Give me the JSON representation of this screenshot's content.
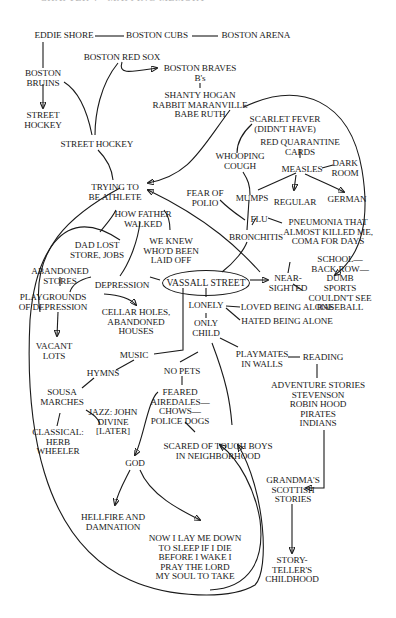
{
  "header": {
    "text": "CHAPTER 4 · MAPPING MEMORY"
  },
  "diagram": {
    "center": "VASSALL STREET",
    "nodes": {
      "eddie_shore": "EDDIE SHORE",
      "boston_cubs": "BOSTON CUBS",
      "boston_arena": "BOSTON ARENA",
      "boston_bruins": "BOSTON\nBRUINS",
      "street_hockey_1": "STREET\nHOCKEY",
      "boston_red_sox": "BOSTON RED SOX",
      "boston_braves": "BOSTON BRAVES\nB's",
      "braves_players": "SHANTY HOGAN\nRABBIT MARANVILLE\nBABE RUTH",
      "street_hockey_2": "STREET HOCKEY",
      "scarlet_fever": "SCARLET FEVER\n(DIDN'T HAVE)",
      "red_quarantine": "RED QUARANTINE\nCARDS",
      "whooping_cough": "WHOOPING\nCOUGH",
      "measles": "MEASLES",
      "dark_room": "DARK\nROOM",
      "trying_athlete": "TRYING TO\nBE ATHLETE",
      "fear_polio": "FEAR OF\nPOLIO",
      "mumps": "MUMPS",
      "regular": "REGULAR",
      "german": "GERMAN",
      "how_father_walked": "HOW FATHER\nWALKED",
      "flu": "FLU",
      "pneumonia": "PNEUMONIA THAT\nALMOST KILLED ME,\nCOMA FOR DAYS",
      "bronchitis": "BRONCHITIS",
      "dad_lost_store": "DAD LOST\nSTORE, JOBS",
      "we_knew": "WE KNEW\nWHO'D BEEN\nLAID OFF",
      "school": "SCHOOL—\nBACK ROW—\nDUMB",
      "abandoned_stores": "ABANDONED\nSTORES",
      "depression": "DEPRESSION",
      "near_sighted": "NEAR-\nSIGHTED",
      "sports": "SPORTS\nCOULDN'T SEE\nBASEBALL",
      "playgrounds": "PLAYGROUNDS\nOF DEPRESSION",
      "cellar_holes": "CELLAR HOLES,\nABANDONED\nHOUSES",
      "lonely": "LONELY",
      "loved_alone": "LOVED BEING ALONE",
      "hated_alone": "HATED BEING ALONE",
      "only_child": "ONLY\nCHILD",
      "vacant_lots": "VACANT\nLOTS",
      "music": "MUSIC",
      "playmates": "PLAYMATES\nIN WALLS",
      "reading": "READING",
      "hymns": "HYMNS",
      "no_pets": "NO PETS",
      "sousa": "SOUSA\nMARCHES",
      "feared_dogs": "FEARED\nAIREDALES—\nCHOWS—\nPOLICE DOGS",
      "adventure": "ADVENTURE STORIES\nSTEVENSON\nROBIN HOOD\nPIRATES\nINDIANS",
      "jazz": "JAZZ: JOHN\nDIVINE\n[LATER]",
      "classical": "CLASSICAL:\nHERB\nWHEELER",
      "scared_boys": "SCARED OF TOUGH BOYS\nIN NEIGHBORHOOD",
      "god": "GOD",
      "grandma": "GRANDMA'S\nSCOTTISH\nSTORIES",
      "hellfire": "HELLFIRE AND\nDAMNATION",
      "now_i_lay": "NOW I LAY ME DOWN\nTO SLEEP IF I DIE\nBEFORE I WAKE I\nPRAY THE LORD\nMY SOUL TO TAKE",
      "storyteller": "STORY-\nTELLER'S\nCHILDHOOD"
    }
  }
}
